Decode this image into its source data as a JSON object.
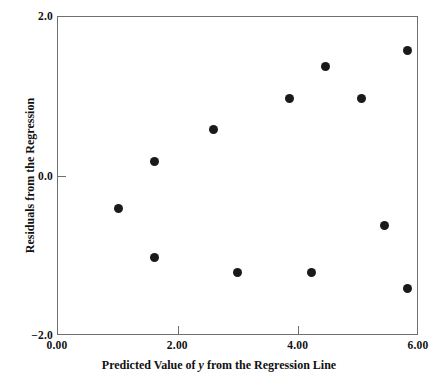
{
  "chart_data": {
    "type": "scatter",
    "title": "",
    "xlabel_parts": {
      "before": "Predicted Value of ",
      "italic": "y",
      "after": " from the Regression Line"
    },
    "xlabel": "Predicted Value of y from the Regression Line",
    "ylabel": "Residuals from the Regression",
    "xlim": [
      0.0,
      6.0
    ],
    "ylim": [
      -2.0,
      2.0
    ],
    "xticks": [
      0.0,
      2.0,
      4.0,
      6.0
    ],
    "xtick_labels": [
      "0.00",
      "2.00",
      "4.00",
      "6.00"
    ],
    "yticks": [
      2.0,
      0.0,
      -2.0
    ],
    "ytick_labels": [
      "2.0",
      "0.0",
      "−2.0"
    ],
    "grid": false,
    "legend": null,
    "marker": "filled-circle",
    "marker_color": "#1a1a1a",
    "marker_size_px": 9,
    "frame_color": "#6f6f6f",
    "points": [
      {
        "x": 1.0,
        "y": -0.4
      },
      {
        "x": 1.61,
        "y": 0.19
      },
      {
        "x": 1.61,
        "y": -1.01
      },
      {
        "x": 2.59,
        "y": 0.59
      },
      {
        "x": 2.99,
        "y": -1.21
      },
      {
        "x": 3.84,
        "y": 0.98
      },
      {
        "x": 4.22,
        "y": -1.21
      },
      {
        "x": 4.44,
        "y": 1.38
      },
      {
        "x": 5.04,
        "y": 0.98
      },
      {
        "x": 5.42,
        "y": -0.62
      },
      {
        "x": 5.81,
        "y": 1.58
      },
      {
        "x": 5.81,
        "y": -1.41
      }
    ]
  }
}
